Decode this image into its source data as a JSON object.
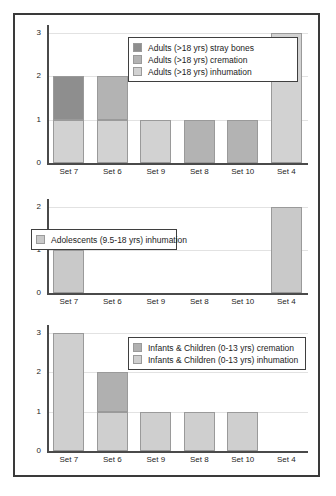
{
  "figure": {
    "background": "#ffffff",
    "frame_color": "#3a3a3a"
  },
  "colors": {
    "dark_gray": "#8e8e8e",
    "medium_gray": "#b3b3b3",
    "light_gray": "#d2d2d2",
    "gridline": "#e2e2e2",
    "axis": "#4a4a4a"
  },
  "chart_data": [
    {
      "type": "bar",
      "title": "",
      "stacked": true,
      "xlabel": "",
      "ylabel": "",
      "ylim": [
        0,
        3
      ],
      "yticks": [
        "0",
        "1",
        "2",
        "3"
      ],
      "grid": true,
      "legend_position": "upper center",
      "categories": [
        "Set 7",
        "Set 6",
        "Set 9",
        "Set 8",
        "Set 10",
        "Set 4"
      ],
      "series": [
        {
          "name": "Adults (>18 yrs) inhumation",
          "color": "#d2d2d2",
          "values": [
            1,
            1,
            1,
            0,
            0,
            3
          ]
        },
        {
          "name": "Adults (>18 yrs) cremation",
          "color": "#b3b3b3",
          "values": [
            0,
            1,
            0,
            1,
            1,
            0
          ]
        },
        {
          "name": "Adults (>18 yrs) stray bones",
          "color": "#8e8e8e",
          "values": [
            1,
            0,
            0,
            0,
            0,
            0
          ]
        }
      ],
      "legend_order": [
        "Adults (>18 yrs) stray bones",
        "Adults (>18 yrs) cremation",
        "Adults (>18 yrs) inhumation"
      ]
    },
    {
      "type": "bar",
      "title": "",
      "stacked": true,
      "xlabel": "",
      "ylabel": "",
      "ylim": [
        0,
        2
      ],
      "yticks": [
        "0",
        "1",
        "2"
      ],
      "grid": true,
      "legend_position": "upper left",
      "categories": [
        "Set 7",
        "Set 6",
        "Set 9",
        "Set 8",
        "Set 10",
        "Set 4"
      ],
      "series": [
        {
          "name": "Adolescents (9.5-18 yrs) inhumation",
          "color": "#c9c9c9",
          "values": [
            1,
            0,
            0,
            0,
            0,
            2
          ]
        }
      ],
      "legend_order": [
        "Adolescents (9.5-18 yrs) inhumation"
      ]
    },
    {
      "type": "bar",
      "title": "",
      "stacked": true,
      "xlabel": "",
      "ylabel": "",
      "ylim": [
        0,
        3
      ],
      "yticks": [
        "0",
        "1",
        "2",
        "3"
      ],
      "grid": true,
      "legend_position": "upper center",
      "categories": [
        "Set 7",
        "Set 6",
        "Set 9",
        "Set 8",
        "Set 10",
        "Set 4"
      ],
      "series": [
        {
          "name": "Infants & Children (0-13 yrs) inhumation",
          "color": "#cfcfcf",
          "values": [
            3,
            1,
            1,
            1,
            1,
            0
          ]
        },
        {
          "name": "Infants & Children (0-13 yrs) cremation",
          "color": "#b0b0b0",
          "values": [
            0,
            1,
            0,
            0,
            0,
            0
          ]
        }
      ],
      "legend_order": [
        "Infants & Children (0-13 yrs) cremation",
        "Infants & Children (0-13 yrs) inhumation"
      ]
    }
  ]
}
